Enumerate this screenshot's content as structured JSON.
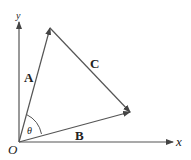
{
  "diagram": {
    "axes": {
      "x_label": "x",
      "y_label": "y",
      "origin_label": "O"
    },
    "vectors": [
      {
        "name": "A",
        "label": "A",
        "from": "O",
        "to": "tip of A"
      },
      {
        "name": "B",
        "label": "B",
        "from": "O",
        "to": "tip of B"
      },
      {
        "name": "C",
        "label": "C",
        "from": "tip of A",
        "to": "tip of B"
      }
    ],
    "angle": {
      "label": "θ",
      "between": [
        "A",
        "B"
      ]
    },
    "colors": {
      "line": "#555555",
      "text": "#222222",
      "background": "#ffffff"
    }
  }
}
